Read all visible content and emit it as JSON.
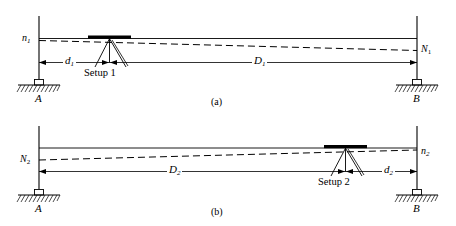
{
  "figure": {
    "type": "engineering-diagram",
    "panels": [
      {
        "id": "a",
        "caption": "(a)",
        "left_station_label": "A",
        "right_station_label": "B",
        "left_reading_label": "n",
        "left_reading_sub": "1",
        "right_reading_label": "N",
        "right_reading_sub": "1",
        "instrument_label": "Setup 1",
        "short_distance_label": "d",
        "short_distance_sub": "1",
        "long_distance_label": "D",
        "long_distance_sub": "1",
        "instrument_position": "near-left-station",
        "line_of_sight": "dashed-descending-to-right",
        "horizontal_reference": "solid-level-line"
      },
      {
        "id": "b",
        "caption": "(b)",
        "left_station_label": "A",
        "right_station_label": "B",
        "left_reading_label": "N",
        "left_reading_sub": "2",
        "right_reading_label": "n",
        "right_reading_sub": "2",
        "instrument_label": "Setup 2",
        "short_distance_label": "d",
        "short_distance_sub": "2",
        "long_distance_label": "D",
        "long_distance_sub": "2",
        "instrument_position": "near-right-station",
        "line_of_sight": "dashed-ascending-to-right",
        "horizontal_reference": "solid-level-line"
      }
    ],
    "colors": {
      "line": "#000000",
      "background": "#ffffff",
      "instrument_bar": "#000000"
    }
  }
}
